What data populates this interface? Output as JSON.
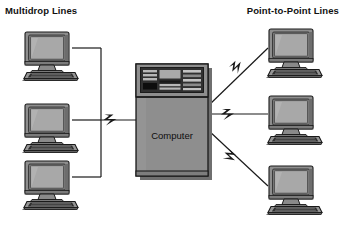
{
  "figure": {
    "title_left": "Multidrop Lines",
    "title_right": "Point-to-Point Lines",
    "central_node_label": "Computer",
    "background_color": "#ffffff",
    "line_color": "#1a1a1a",
    "case_fill": "#8e8e8e",
    "screen_fill": "#a5a5a5",
    "panel_fill": "#3a3a3a"
  },
  "nodes": {
    "central": {
      "name": "Computer",
      "type": "mainframe",
      "x": 136,
      "y": 64,
      "width": 72,
      "height": 112
    },
    "multidrop_terminals": [
      {
        "label": "terminal-1",
        "x": 18,
        "y": 31
      },
      {
        "label": "terminal-2",
        "x": 18,
        "y": 103
      },
      {
        "label": "terminal-3",
        "x": 18,
        "y": 160
      }
    ],
    "point_to_point_terminals": [
      {
        "label": "terminal-4",
        "x": 262,
        "y": 28
      },
      {
        "label": "terminal-5",
        "x": 262,
        "y": 95
      },
      {
        "label": "terminal-6",
        "x": 262,
        "y": 165
      }
    ]
  },
  "links": {
    "multidrop": {
      "style": "bus-trunk",
      "description": "Shared vertical trunk with horizontal drops to three terminals",
      "trunk_x": 101,
      "drop_ys": [
        48,
        120,
        177
      ],
      "junction_y": 120
    },
    "point_to_point": {
      "style": "dedicated-with-break",
      "description": "Three dedicated diagonal lines each carrying a lightning-bolt break symbol",
      "count": 3
    }
  },
  "icons": {
    "terminal": "computer-terminal-icon",
    "mainframe": "mainframe-icon",
    "break": "lightning-bolt-icon"
  }
}
